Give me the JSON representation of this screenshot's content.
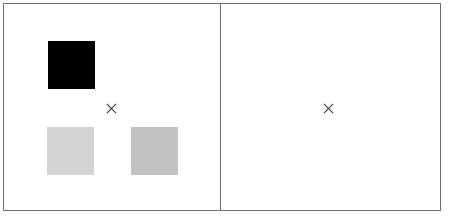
{
  "display": {
    "panels": [
      {
        "id": "left",
        "fixation": "cross",
        "squares": [
          {
            "position": "top-left",
            "color": "#000000"
          },
          {
            "position": "bottom-left",
            "color": "#d4d4d4"
          },
          {
            "position": "bottom-right",
            "color": "#c2c2c2"
          }
        ]
      },
      {
        "id": "right",
        "fixation": "cross",
        "squares": []
      }
    ],
    "colors": {
      "border": "#707070",
      "background": "#ffffff",
      "fixation": "#333333"
    }
  }
}
